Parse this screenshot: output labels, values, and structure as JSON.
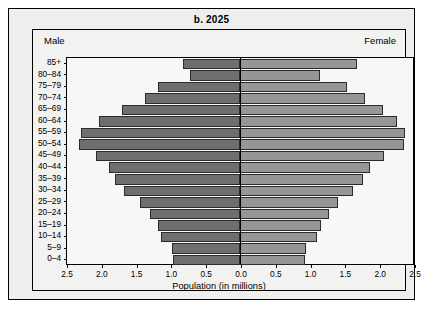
{
  "figure": {
    "title": "b. 2025",
    "male_label": "Male",
    "female_label": "Female",
    "x_axis_title": "Population (in millions)"
  },
  "chart_data": {
    "type": "bar",
    "subtype": "population-pyramid",
    "title": "b. 2025",
    "xlabel": "Population (in millions)",
    "ylabel": "",
    "xlim": [
      -2.5,
      2.5
    ],
    "x_tick_labels": [
      "2.5",
      "2.0",
      "1.5",
      "1.0",
      "0.5",
      "0.0",
      "0.5",
      "1.0",
      "1.5",
      "2.0",
      "2.5"
    ],
    "x_tick_values": [
      -2.5,
      -2.0,
      -1.5,
      -1.0,
      -0.5,
      0.0,
      0.5,
      1.0,
      1.5,
      2.0,
      2.5
    ],
    "grid": false,
    "legend_position": "inline-top-corners",
    "categories": [
      "85+",
      "80–84",
      "75–79",
      "70–74",
      "65–69",
      "60–64",
      "55–59",
      "50–54",
      "45–49",
      "40–44",
      "35–39",
      "30–34",
      "25–29",
      "20–24",
      "15–19",
      "10–14",
      "5–9",
      "0–4"
    ],
    "series": [
      {
        "name": "Male",
        "direction": "left",
        "color": "#6e6e6e",
        "values": [
          0.82,
          0.72,
          1.18,
          1.37,
          1.7,
          2.03,
          2.29,
          2.32,
          2.07,
          1.88,
          1.8,
          1.66,
          1.44,
          1.3,
          1.18,
          1.13,
          0.98,
          0.97
        ]
      },
      {
        "name": "Female",
        "direction": "right",
        "color": "#969696",
        "values": [
          1.68,
          1.15,
          1.54,
          1.8,
          2.05,
          2.25,
          2.37,
          2.36,
          2.07,
          1.87,
          1.77,
          1.62,
          1.41,
          1.28,
          1.16,
          1.1,
          0.95,
          0.93
        ]
      }
    ]
  },
  "colors": {
    "male_bar": "#6e6e6e",
    "female_bar": "#969696",
    "figure_background": "#eeeeec",
    "plot_background": "#f7f7f5",
    "axis": "#000000"
  }
}
